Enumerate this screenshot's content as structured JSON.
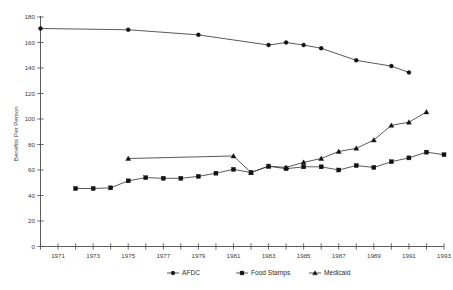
{
  "chart_data": {
    "type": "line",
    "title": "",
    "xlabel": "",
    "ylabel": "Benefits Per Person",
    "ylim": [
      0,
      180
    ],
    "ytick_step": 20,
    "yticks": [
      0,
      20,
      40,
      60,
      80,
      100,
      120,
      140,
      160,
      180
    ],
    "xlim": [
      1970,
      1993
    ],
    "xticks": [
      1971,
      1973,
      1975,
      1977,
      1979,
      1981,
      1983,
      1985,
      1987,
      1989,
      1991,
      1993
    ],
    "x_minor_every": 1,
    "grid": false,
    "legend_position": "bottom-center",
    "x": [
      1970,
      1971,
      1972,
      1973,
      1974,
      1975,
      1976,
      1977,
      1978,
      1979,
      1980,
      1981,
      1982,
      1983,
      1984,
      1985,
      1986,
      1987,
      1988,
      1989,
      1990,
      1991,
      1992,
      1993
    ],
    "series": [
      {
        "name": "AFDC",
        "marker": "circle",
        "x": [
          1970,
          1975,
          1979,
          1983,
          1984,
          1985,
          1986,
          1988,
          1990,
          1991,
          1992,
          1993
        ],
        "values": [
          171,
          170,
          166,
          158,
          160,
          158,
          155.5,
          146,
          141.5,
          136.5,
          null,
          null
        ]
      },
      {
        "name": "Food Stamps",
        "marker": "square",
        "x": [
          1972,
          1973,
          1974,
          1975,
          1976,
          1977,
          1978,
          1979,
          1980,
          1981,
          1982,
          1983,
          1984,
          1985,
          1986,
          1987,
          1988,
          1989,
          1990,
          1991,
          1992,
          1993
        ],
        "values": [
          45.5,
          45.5,
          46,
          51.5,
          54,
          53.5,
          53.5,
          55,
          57.5,
          60.5,
          58,
          63,
          61,
          62.5,
          62.5,
          60,
          63.5,
          62,
          66.5,
          69.5,
          74,
          72
        ]
      },
      {
        "name": "Medicaid",
        "marker": "triangle",
        "x": [
          1975,
          1981,
          1982,
          1983,
          1984,
          1985,
          1986,
          1987,
          1988,
          1989,
          1990,
          1991,
          1992
        ],
        "values": [
          69,
          71,
          58,
          63,
          62,
          66,
          69,
          74.5,
          77,
          83.5,
          95,
          97.5,
          105.5
        ]
      }
    ]
  },
  "legend": {
    "items": [
      {
        "label": "AFDC",
        "marker": "circle"
      },
      {
        "label": "Food Stamps",
        "marker": "square"
      },
      {
        "label": "Medicaid",
        "marker": "triangle"
      }
    ]
  },
  "axis": {
    "y_title": "Benefits Per Person",
    "y_tick_labels": [
      "0",
      "20",
      "40",
      "60",
      "80",
      "100",
      "120",
      "140",
      "160",
      "180"
    ],
    "x_tick_labels": [
      "1971",
      "1973",
      "1975",
      "1977",
      "1979",
      "1981",
      "1983",
      "1985",
      "1987",
      "1989",
      "1991",
      "1993"
    ]
  },
  "colors": {
    "line": "#3b3b3b",
    "marker": "#111111",
    "axis": "#4a4a4a",
    "text": "#3a3a3a",
    "background": "#ffffff"
  }
}
